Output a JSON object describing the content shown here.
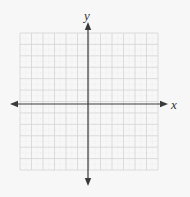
{
  "diagram": {
    "type": "cartesian-coordinate-plane",
    "background_color": "#f7f7f7",
    "grid": {
      "left": 20,
      "top": 33,
      "right": 158,
      "bottom": 170,
      "cells_x": 12,
      "cells_y": 12,
      "major_line_color": "#d4d4d4",
      "minor_line_color": "#e6e6e6",
      "minor_dotted": true
    },
    "origin": {
      "x": 88,
      "y": 104
    },
    "axes": {
      "color": "#3a3a3a",
      "width": 1.2,
      "x_axis": {
        "from": 10,
        "to": 168,
        "arrows": "both",
        "label": "x"
      },
      "y_axis": {
        "from": 22,
        "to": 186,
        "arrows": "both",
        "label": "y"
      }
    },
    "labels": {
      "x": "x",
      "y": "y"
    }
  }
}
